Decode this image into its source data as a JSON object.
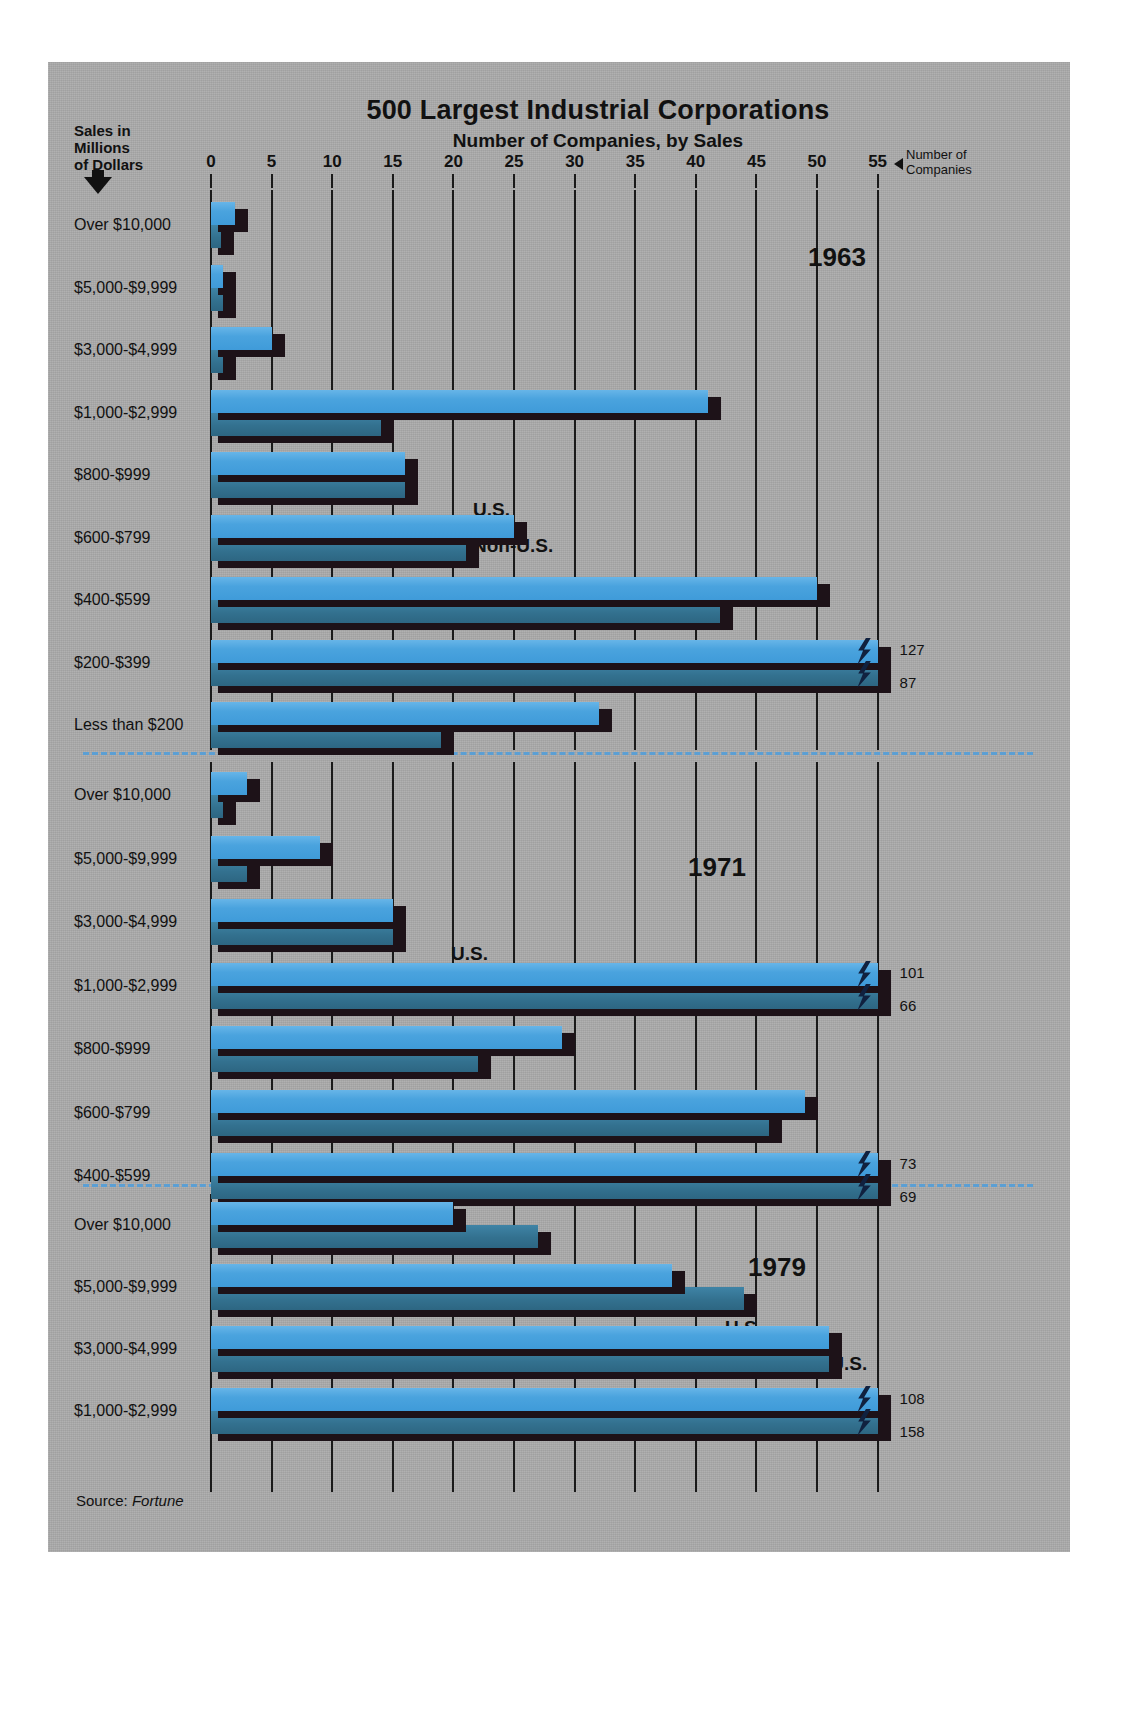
{
  "title": "500 Largest Industrial Corporations",
  "subtitle": "Number of Companies, by Sales",
  "left_axis_caption": "Sales in\nMillions\nof Dollars",
  "left_axis_caption_lines": [
    "Sales in",
    "Millions",
    "of Dollars"
  ],
  "right_axis_caption_lines": [
    "Number of",
    "Companies"
  ],
  "source": "Source: ",
  "source_name": "Fortune",
  "legend": {
    "us": "U.S.",
    "nonus": "Non-U.S."
  },
  "colors": {
    "background": "#ababab",
    "us_bar": "#4aa3de",
    "nonus_bar": "#33718f",
    "shadow": "#1d1218",
    "divider": "#5b9fd4",
    "text": "#111111"
  },
  "chart_data": {
    "type": "bar",
    "orientation": "horizontal",
    "title": "500 Largest Industrial Corporations",
    "subtitle": "Number of Companies, by Sales",
    "xlabel": "Number of Companies",
    "ylabel": "Sales in Millions of Dollars",
    "xlim": [
      0,
      55
    ],
    "xticks": [
      0,
      5,
      10,
      15,
      20,
      25,
      30,
      35,
      40,
      45,
      50,
      55
    ],
    "xtick_labels": [
      "0",
      "5",
      "10",
      "15",
      "20",
      "25",
      "30",
      "35",
      "40",
      "45",
      "50",
      "55"
    ],
    "grid": true,
    "legend_entries": [
      "U.S.",
      "Non-U.S."
    ],
    "legend_position": "inline-per-panel",
    "note": "Bars marked with a lightning-bolt break exceed the 55 axis maximum; their true values are printed at the bar end.",
    "panels": [
      {
        "year": "1963",
        "categories": [
          "Over $10,000",
          "$5,000-$9,999",
          "$3,000-$4,999",
          "$1,000-$2,999",
          "$800-$999",
          "$600-$799",
          "$400-$599",
          "$200-$399",
          "Less than $200"
        ],
        "series": [
          {
            "name": "U.S.",
            "values": [
              2,
              1,
              5,
              41,
              16,
              25,
              50,
              127,
              32
            ]
          },
          {
            "name": "Non-U.S.",
            "values": [
              0.8,
              1,
              1,
              14,
              16,
              21,
              42,
              87,
              19
            ]
          }
        ],
        "overflow_labels": {
          "$200-$399": {
            "U.S.": "127",
            "Non-U.S.": "87"
          }
        }
      },
      {
        "year": "1971",
        "categories": [
          "Over $10,000",
          "$5,000-$9,999",
          "$3,000-$4,999",
          "$1,000-$2,999",
          "$800-$999",
          "$600-$799",
          "$400-$599"
        ],
        "series": [
          {
            "name": "U.S.",
            "values": [
              3,
              9,
              15,
              101,
              29,
              49,
              73
            ]
          },
          {
            "name": "Non-U.S.",
            "values": [
              1,
              3,
              15,
              66,
              22,
              46,
              69
            ]
          }
        ],
        "overflow_labels": {
          "$1,000-$2,999": {
            "U.S.": "101",
            "Non-U.S.": "66"
          },
          "$400-$599": {
            "U.S.": "73",
            "Non-U.S.": "69"
          }
        }
      },
      {
        "year": "1979",
        "categories": [
          "Over $10,000",
          "$5,000-$9,999",
          "$3,000-$4,999",
          "$1,000-$2,999"
        ],
        "series": [
          {
            "name": "U.S.",
            "values": [
              20,
              38,
              51,
              108
            ]
          },
          {
            "name": "Non-U.S.",
            "values": [
              27,
              44,
              51,
              158
            ]
          }
        ],
        "overflow_labels": {
          "$1,000-$2,999": {
            "U.S.": "108",
            "Non-U.S.": "158"
          }
        }
      }
    ]
  }
}
